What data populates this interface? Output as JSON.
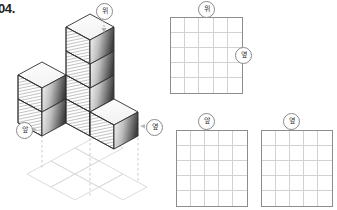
{
  "problem": {
    "number": "04."
  },
  "labels": {
    "top": "위",
    "side": "옆",
    "front": "앞"
  },
  "isometric": {
    "name": "cube-stack-figure",
    "description": "isometric stack of unit cubes with dashed projection lines onto a ghost floor grid",
    "callouts": [
      {
        "name": "callout-top",
        "text": "위",
        "x": 96,
        "y": 3
      },
      {
        "name": "callout-front",
        "text": "앞",
        "x": 16,
        "y": 122
      },
      {
        "name": "callout-side",
        "text": "옆",
        "x": 146,
        "y": 119
      }
    ]
  },
  "grids": [
    {
      "name": "grid-top-view",
      "view_label": "위",
      "side_label": "옆",
      "cols": 5,
      "rows": 5,
      "left": 170,
      "top": 17,
      "width": 73,
      "height": 77,
      "callout_top": {
        "text": "위",
        "x": 198,
        "y": 1
      },
      "callout_side": {
        "text": "옆",
        "x": 235,
        "y": 47
      }
    },
    {
      "name": "grid-front-view",
      "view_label": "앞",
      "cols": 5,
      "rows": 5,
      "left": 176,
      "top": 130,
      "width": 72,
      "height": 77,
      "callout_top": {
        "text": "앞",
        "x": 198,
        "y": 113
      }
    },
    {
      "name": "grid-side-view",
      "view_label": "옆",
      "cols": 5,
      "rows": 5,
      "left": 261,
      "top": 130,
      "width": 72,
      "height": 77,
      "callout_top": {
        "text": "옆",
        "x": 283,
        "y": 113
      }
    }
  ],
  "colors": {
    "ink": "#231f20",
    "grid_border": "#8d8d8d",
    "grid_line": "#d2d2d2",
    "bubble_border": "#8a8a8a",
    "cube_stroke": "#2b2b2b",
    "cube_top": "#ffffff",
    "ghost": "#d8d8d8",
    "dash": "#c4c4c4"
  }
}
